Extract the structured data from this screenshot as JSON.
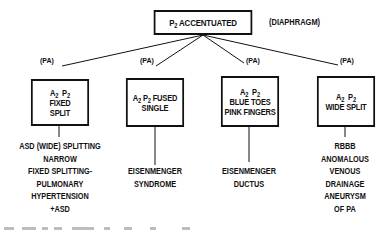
{
  "diagram": {
    "root": {
      "label_base": "P",
      "label_sub": "2",
      "label_rest": "ACCENTUATED",
      "side_note": "(DIAPHRAGM)"
    },
    "branch_label": "(PA)",
    "branches": [
      {
        "box_lines": [
          {
            "a": "A",
            "a_sub": "2",
            "p": "P",
            "p_sub": "2"
          },
          {
            "text": "FIXED"
          },
          {
            "text": "SPLIT"
          }
        ],
        "description": [
          "ASD (WIDE) SPLITTING",
          "NARROW",
          "FIXED SPLITTING-",
          "PULMONARY",
          "HYPERTENSION",
          "+ASD"
        ]
      },
      {
        "box_lines": [
          {
            "a": "A",
            "a_sub": "2",
            "p": "P",
            "p_sub": "2",
            "suffix": "FUSED"
          },
          {
            "text": "SINGLE"
          }
        ],
        "description": [
          "EISENMENGER",
          "SYNDROME"
        ]
      },
      {
        "box_lines": [
          {
            "a": "A",
            "a_sub": "2",
            "p": "P",
            "p_sub": "2"
          },
          {
            "text": "BLUE TOES"
          },
          {
            "text": "PINK FINGERS"
          }
        ],
        "description": [
          "EISENMENGER",
          "DUCTUS"
        ]
      },
      {
        "box_lines": [
          {
            "a": "A",
            "a_sub": "2",
            "p": "P",
            "p_sub": "2"
          },
          {
            "text": "WIDE SPLIT"
          }
        ],
        "description": [
          "RBBB",
          "ANOMALOUS",
          "VENOUS",
          "DRAINAGE",
          "ANEURYSM",
          "OF PA"
        ]
      }
    ]
  },
  "colors": {
    "ink": "#111111",
    "background": "#ffffff"
  }
}
